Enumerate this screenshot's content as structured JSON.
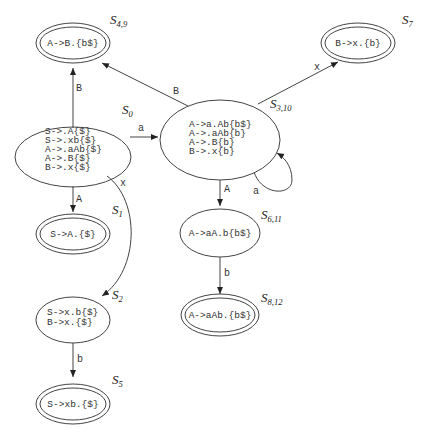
{
  "diagram": {
    "type": "LR automaton",
    "states": [
      {
        "id": "S0",
        "label_main": "S",
        "label_sub": "0",
        "accepting": false,
        "items": [
          "S->.A{$}",
          "S->.xb{$}",
          "A->.aAb{$}",
          "A->.B{$}",
          "B->.x{$}"
        ]
      },
      {
        "id": "S1",
        "label_main": "S",
        "label_sub": "1",
        "accepting": true,
        "items": [
          "S->A.{$}"
        ]
      },
      {
        "id": "S2",
        "label_main": "S",
        "label_sub": "2",
        "accepting": false,
        "items": [
          "S->x.b{$}",
          "B->x.{$}"
        ]
      },
      {
        "id": "S3_10",
        "label_main": "S",
        "label_sub": "3,10",
        "accepting": false,
        "items": [
          "A->a.Ab{b$}",
          "A->.aAb{b}",
          "A->.B{b}",
          "B->.x{b}"
        ]
      },
      {
        "id": "S4_9",
        "label_main": "S",
        "label_sub": "4,9",
        "accepting": true,
        "items": [
          "A->B.{b$}"
        ]
      },
      {
        "id": "S5",
        "label_main": "S",
        "label_sub": "5",
        "accepting": true,
        "items": [
          "S->xb.{$}"
        ]
      },
      {
        "id": "S6_11",
        "label_main": "S",
        "label_sub": "6,11",
        "accepting": false,
        "items": [
          "A->aA.b{b$}"
        ]
      },
      {
        "id": "S7",
        "label_main": "S",
        "label_sub": "7",
        "accepting": true,
        "items": [
          "B->x.{b}"
        ]
      },
      {
        "id": "S8_12",
        "label_main": "S",
        "label_sub": "8,12",
        "accepting": true,
        "items": [
          "A->aAb.{b$}"
        ]
      }
    ],
    "edges": [
      {
        "from": "S0",
        "to": "S4_9",
        "label": "B"
      },
      {
        "from": "S0",
        "to": "S3_10",
        "label": "a"
      },
      {
        "from": "S0",
        "to": "S1",
        "label": "A"
      },
      {
        "from": "S0",
        "to": "S2",
        "label": "x"
      },
      {
        "from": "S2",
        "to": "S5",
        "label": "b"
      },
      {
        "from": "S3_10",
        "to": "S4_9",
        "label": "B"
      },
      {
        "from": "S3_10",
        "to": "S7",
        "label": "x"
      },
      {
        "from": "S3_10",
        "to": "S3_10",
        "label": "a"
      },
      {
        "from": "S3_10",
        "to": "S6_11",
        "label": "A"
      },
      {
        "from": "S6_11",
        "to": "S8_12",
        "label": "b"
      }
    ]
  }
}
